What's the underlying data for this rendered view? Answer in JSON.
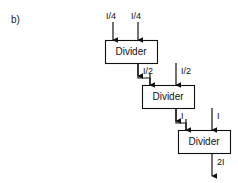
{
  "figure": {
    "panel_label": "b)",
    "blocks": [
      {
        "id": "divider-1",
        "label": "Divider",
        "x": 105,
        "y": 40,
        "w": 52,
        "h": 23
      },
      {
        "id": "divider-2",
        "label": "Divider",
        "x": 142,
        "y": 85,
        "w": 52,
        "h": 23
      },
      {
        "id": "divider-3",
        "label": "Divider",
        "x": 178,
        "y": 130,
        "w": 52,
        "h": 23
      }
    ],
    "signals": [
      {
        "id": "in-1a",
        "label": "I/4",
        "label_x": 106,
        "label_y": 12,
        "arrow_x": 113,
        "y_start": 22,
        "y_end": 40
      },
      {
        "id": "in-1b",
        "label": "I/4",
        "label_x": 131,
        "label_y": 12,
        "arrow_x": 138,
        "y_start": 22,
        "y_end": 40
      },
      {
        "id": "out-1",
        "label": "I/2",
        "label_x": 143,
        "label_y": 67,
        "arrow_x": 138,
        "y_start": 63,
        "y_end": 85
      },
      {
        "id": "in-2b",
        "label": "I/2",
        "label_x": 181,
        "label_y": 67,
        "arrow_x": 176,
        "y_start": 63,
        "y_end": 85
      },
      {
        "id": "out-2",
        "label": "I",
        "label_x": 181,
        "label_y": 112,
        "arrow_x": 176,
        "y_start": 108,
        "y_end": 130
      },
      {
        "id": "in-3b",
        "label": "I",
        "label_x": 217,
        "label_y": 112,
        "arrow_x": 212,
        "y_start": 108,
        "y_end": 130
      },
      {
        "id": "out-3",
        "label": "2I",
        "label_x": 217,
        "label_y": 158,
        "arrow_x": 212,
        "y_start": 153,
        "y_end": 176
      }
    ],
    "connectors": [
      {
        "id": "conn-1-to-2",
        "from_x": 138,
        "from_y": 63,
        "to_x": 150,
        "to_y": 85
      },
      {
        "id": "conn-2-to-3",
        "from_x": 176,
        "from_y": 108,
        "to_x": 186,
        "to_y": 130
      }
    ],
    "colors": {
      "stroke": "#111111",
      "box_fill": "#ffffff",
      "background": "#ffffff",
      "text": "#111111"
    }
  }
}
